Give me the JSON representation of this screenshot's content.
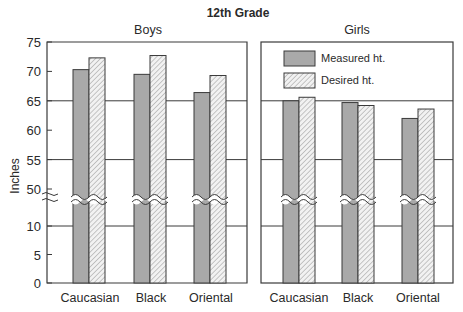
{
  "chart_data": {
    "type": "bar",
    "title": "12th Grade",
    "ylabel": "Inches",
    "xlabel": "",
    "y_axis": {
      "ticks": [
        0,
        5,
        10,
        50,
        55,
        60,
        65,
        70,
        75
      ],
      "broken_between": [
        10,
        50
      ],
      "range": [
        0,
        75
      ]
    },
    "legend": {
      "position": "upper area of Girls panel",
      "entries": [
        {
          "label": "Measured ht.",
          "style": "solid-gray",
          "color": "#a9a9a9"
        },
        {
          "label": "Desired ht.",
          "style": "hatched",
          "color": "#e6e6e6"
        }
      ]
    },
    "grid": "horizontal lines at 10, 55, 65",
    "panels": [
      {
        "title": "Boys",
        "categories": [
          "Caucasian",
          "Black",
          "Oriental"
        ],
        "series": [
          {
            "name": "Measured ht.",
            "values": [
              70.3,
              69.5,
              66.4
            ]
          },
          {
            "name": "Desired ht.",
            "values": [
              72.3,
              72.7,
              69.3
            ]
          }
        ]
      },
      {
        "title": "Girls",
        "categories": [
          "Caucasian",
          "Black",
          "Oriental"
        ],
        "series": [
          {
            "name": "Measured ht.",
            "values": [
              65.0,
              64.7,
              62.0
            ]
          },
          {
            "name": "Desired ht.",
            "values": [
              65.6,
              64.2,
              63.6
            ]
          }
        ]
      }
    ]
  },
  "colors": {
    "measured": "#a9a9a9",
    "desired_bg": "#f0f0f0",
    "hatch": "#8a8a8a",
    "axis": "#3a3a3a"
  }
}
